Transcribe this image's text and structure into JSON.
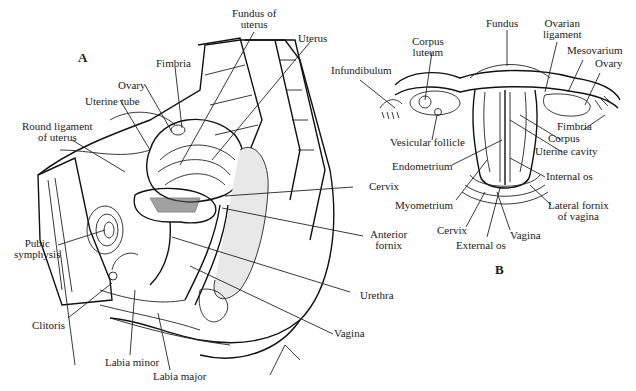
{
  "figure": {
    "panel_a": {
      "letter": "A",
      "labels": {
        "fundus_of_uterus": [
          "Fundus of",
          "uterus"
        ],
        "uterus": "Uterus",
        "fimbria": "Fimbria",
        "ovary": "Ovary",
        "uterine_tube": "Uterine tube",
        "round_ligament": [
          "Round ligament",
          "of uterus"
        ],
        "cervix": "Cervix",
        "anterior_fornix": [
          "Anterior",
          "fornix"
        ],
        "pubic_symphysis": [
          "Pubic",
          "symphysis"
        ],
        "urethra": "Urethra",
        "clitoris": "Clitoris",
        "vagina": "Vagina",
        "labia_minor": "Labia minor",
        "labia_major": "Labia major"
      }
    },
    "panel_b": {
      "letter": "B",
      "labels": {
        "fundus": "Fundus",
        "corpus_luteum": [
          "Corpus",
          "luteum"
        ],
        "ovarian_ligament": [
          "Ovarian",
          "ligament"
        ],
        "mesovarium": "Mesovarium",
        "ovary": "Ovary",
        "infundibulum": "Infundibulum",
        "vesicular_follicle": "Vesicular follicle",
        "fimbria": "Fimbria",
        "corpus": "Corpus",
        "uterine_cavity": "Uterine cavity",
        "endometrium": "Endometrium",
        "internal_os": "Internal os",
        "myometrium": "Myometrium",
        "lateral_fornix": [
          "Lateral fornix",
          "of vagina"
        ],
        "cervix": "Cervix",
        "vagina": "Vagina",
        "external_os": "External os"
      }
    }
  }
}
